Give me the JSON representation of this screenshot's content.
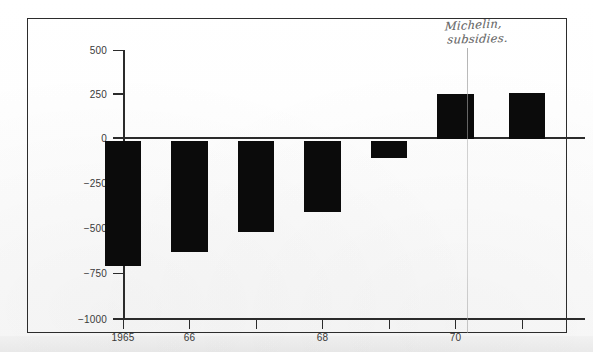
{
  "chart_data": {
    "type": "bar",
    "title": "",
    "subtitle": "",
    "xlabel": "",
    "ylabel": "",
    "categories": [
      "1965",
      "66",
      "67",
      "68",
      "69",
      "70",
      "71"
    ],
    "tick_labels": [
      "1965",
      "66",
      "",
      "68",
      "",
      "70",
      ""
    ],
    "values": [
      -700,
      -620,
      -510,
      -400,
      -100,
      250,
      255
    ],
    "ylim": [
      -1000,
      500
    ],
    "y_ticks": [
      500,
      250,
      0,
      -250,
      -500,
      -750,
      -1000
    ],
    "y_tick_labels": [
      "500",
      "250",
      "0",
      "−250",
      "−500",
      "−750",
      "−1000"
    ],
    "grid": false,
    "legend": "none",
    "bar_color": "#0b0b0b",
    "axis_color": "#2b2b2b",
    "zero_line": 0,
    "annotations": [
      {
        "name": "michelin-subsidies-note",
        "line1": "Michelin,",
        "line2": "subsidies.",
        "style": "handwritten-pencil",
        "color": "#6d6d6d",
        "points_to_category": "70"
      }
    ]
  },
  "figure": {
    "frame_color": "#2c2c2c",
    "background": "#ffffff"
  }
}
